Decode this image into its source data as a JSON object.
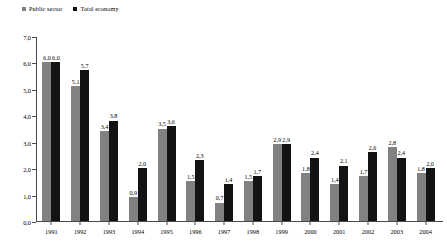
{
  "chart_data": {
    "type": "bar",
    "title": "",
    "xlabel": "",
    "ylabel": "",
    "ylim": [
      0.0,
      7.0
    ],
    "ytick_labels": [
      "0,0",
      "1,0",
      "2,0",
      "3,0",
      "4,0",
      "5,0",
      "6,0",
      "7,0"
    ],
    "ytick_values": [
      0.0,
      1.0,
      2.0,
      3.0,
      4.0,
      5.0,
      6.0,
      7.0
    ],
    "grid": false,
    "legend_position": "top-left",
    "decimal_separator": ",",
    "categories": [
      "1991",
      "1992",
      "1993",
      "1994",
      "1995",
      "1996",
      "1997",
      "1998",
      "1999",
      "2000",
      "2001",
      "2002",
      "2003",
      "2004"
    ],
    "series": [
      {
        "name": "Public sector",
        "color": "#818181",
        "values": [
          6.0,
          5.1,
          3.4,
          0.9,
          3.5,
          1.5,
          0.7,
          1.5,
          2.9,
          1.8,
          1.4,
          1.7,
          2.8,
          1.8
        ],
        "labels": [
          "6,0",
          "5,1",
          "3,4",
          "0,9",
          "3,5",
          "1,5",
          "0,7",
          "1,5",
          "2,9",
          "1,8",
          "1,4",
          "1,7",
          "2,8",
          "1,8"
        ]
      },
      {
        "name": "Total economy",
        "color": "#131313",
        "values": [
          6.0,
          5.7,
          3.8,
          2.0,
          3.6,
          2.3,
          1.4,
          1.7,
          2.9,
          2.4,
          2.1,
          2.6,
          2.4,
          2.0
        ],
        "labels": [
          "6,0",
          "5,7",
          "3,8",
          "2,0",
          "3,6",
          "2,3",
          "1,4",
          "1,7",
          "2,9",
          "2,4",
          "2,1",
          "2,6",
          "2,4",
          "2,0"
        ]
      }
    ]
  }
}
